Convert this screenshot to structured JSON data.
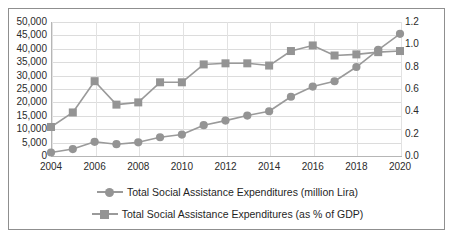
{
  "chart_data": {
    "type": "line",
    "title": "",
    "subtitle": "",
    "xlabel": "",
    "ylabel": "",
    "grid": true,
    "legend_position": "bottom",
    "x": [
      2004,
      2005,
      2006,
      2007,
      2008,
      2009,
      2010,
      2011,
      2012,
      2013,
      2014,
      2015,
      2016,
      2017,
      2018,
      2019,
      2020
    ],
    "x_tick_labels": [
      "2004",
      "2006",
      "2008",
      "2010",
      "2012",
      "2014",
      "2016",
      "2018",
      "2020"
    ],
    "x_tick_values": [
      2004,
      2006,
      2008,
      2010,
      2012,
      2014,
      2016,
      2018,
      2020
    ],
    "xlim": [
      2004,
      2020
    ],
    "axes": [
      {
        "id": "left",
        "label": "",
        "ylim": [
          0,
          50000
        ],
        "tick_values": [
          0,
          5000,
          10000,
          15000,
          20000,
          25000,
          30000,
          35000,
          40000,
          45000,
          50000
        ],
        "tick_labels": [
          "0",
          "5,000",
          "10,000",
          "15,000",
          "20,000",
          "25,000",
          "30,000",
          "35,000",
          "40,000",
          "45,000",
          "50,000"
        ]
      },
      {
        "id": "right",
        "label": "",
        "ylim": [
          0.0,
          1.2
        ],
        "tick_values": [
          0.0,
          0.2,
          0.4,
          0.6,
          0.8,
          1.0,
          1.2
        ],
        "tick_labels": [
          "0.0",
          "0.2",
          "0.4",
          "0.6",
          "0.8",
          "1.0",
          "1.2"
        ]
      }
    ],
    "series": [
      {
        "name": "Total Social Assistance Expenditures (million Lira)",
        "axis": "left",
        "marker": "circle",
        "color": "#949494",
        "values": [
          1300,
          2600,
          5300,
          4400,
          5100,
          7000,
          8000,
          11500,
          13200,
          15100,
          16700,
          22100,
          25900,
          27900,
          33200,
          39600,
          45600
        ]
      },
      {
        "name": "Total Social Assistance Expenditures (as % of GDP)",
        "axis": "right",
        "marker": "square",
        "color": "#949494",
        "values": [
          0.26,
          0.39,
          0.67,
          0.46,
          0.48,
          0.66,
          0.66,
          0.82,
          0.83,
          0.83,
          0.81,
          0.94,
          0.99,
          0.9,
          0.91,
          0.93,
          0.94
        ]
      }
    ]
  },
  "legend": {
    "items": [
      {
        "label": "Total Social Assistance Expenditures (million Lira)",
        "marker": "circle"
      },
      {
        "label": "Total Social Assistance Expenditures (as % of GDP)",
        "marker": "square"
      }
    ]
  },
  "colors": {
    "series": "#949494",
    "line": "#9a9a9a",
    "grid": "#dcdcdc",
    "axis": "#b6b6b6",
    "frame": "#8f8f8f",
    "text": "#2b2b2b"
  }
}
